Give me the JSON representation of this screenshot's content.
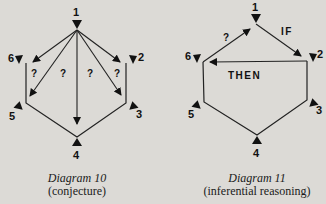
{
  "diagrams": [
    {
      "title": "Diagram 10",
      "subtitle": "(conjecture)",
      "nodes": [
        "1",
        "2",
        "3",
        "4",
        "5",
        "6"
      ],
      "question_marks": [
        "?",
        "?",
        "?",
        "?"
      ]
    },
    {
      "title": "Diagram 11",
      "subtitle": "(inferential reasoning)",
      "nodes": [
        "1",
        "2",
        "3",
        "4",
        "5",
        "6"
      ],
      "labels": {
        "if": "IF",
        "then": "THEN",
        "question": "?"
      }
    }
  ]
}
